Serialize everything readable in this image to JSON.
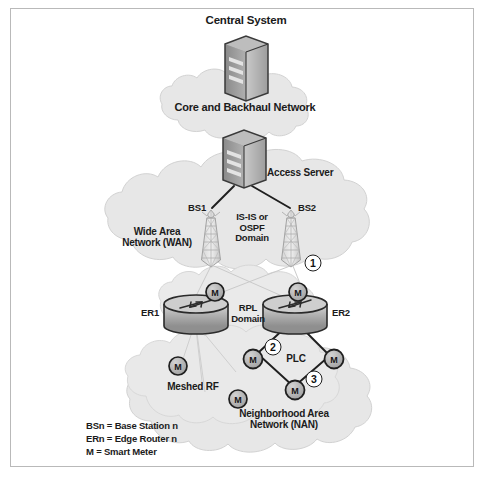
{
  "diagram": {
    "labels": {
      "central_system": "Central System",
      "core_backhaul": "Core and Backhaul Network",
      "access_server": "Access Server",
      "bs1": "BS1",
      "bs2": "BS2",
      "isis_ospf_domain": "IS-IS or\nOSPF\nDomain",
      "wan": "Wide Area\nNetwork (WAN)",
      "er1": "ER1",
      "er2": "ER2",
      "rpl_domain": "RPL\nDomain",
      "plc": "PLC",
      "meshed_rf": "Meshed RF",
      "nan": "Neighborhood Area\nNetwork (NAN)"
    },
    "markers": [
      {
        "id": "marker-1",
        "text": "1",
        "x": 313,
        "y": 263
      },
      {
        "id": "marker-2",
        "text": "2",
        "x": 273,
        "y": 347
      },
      {
        "id": "marker-3",
        "text": "3",
        "x": 314,
        "y": 379
      }
    ],
    "legend": "BSn = Base Station n\nERn = Edge Router n\nM = Smart Meter",
    "meter_badge": "M",
    "colors": {
      "cloud_fill": "#e7e7e7",
      "cloud_stroke": "#d2d2d2",
      "device_dark": "#6f6f6f",
      "device_light": "#cfcfcf",
      "line_dark": "#1f1f1f",
      "line_faint": "#cacaca",
      "text": "#1b1b1b",
      "frame": "#b9b9b9"
    }
  }
}
